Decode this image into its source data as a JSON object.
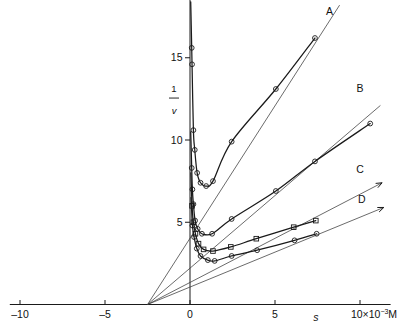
{
  "figure": {
    "title": "",
    "x_axis_label": "s",
    "x_axis_unit_label": "10×10⁻³M",
    "y_axis_label_numerator": "1",
    "y_axis_label_denominator": "v"
  },
  "axes": {
    "x_ticks": [
      {
        "value": -10,
        "label": "–10"
      },
      {
        "value": -5,
        "label": "–5"
      },
      {
        "value": 0,
        "label": "0"
      },
      {
        "value": 5,
        "label": "5"
      },
      {
        "value": 10,
        "label": "10×10⁻³M"
      }
    ],
    "y_ticks": [
      {
        "value": 5,
        "label": "5"
      },
      {
        "value": 10,
        "label": "10"
      },
      {
        "value": 15,
        "label": "15"
      }
    ]
  },
  "chart_data": {
    "type": "line",
    "title": "",
    "xlabel": "s",
    "ylabel": "1/v",
    "xlim": [
      -10.5,
      11.5
    ],
    "ylim": [
      0,
      18.5
    ],
    "grid": false,
    "legend_position": "inline-right-of-curve-ends",
    "x_unit": "10^-3 M",
    "annotations": [
      {
        "text": "A",
        "x": 8.2,
        "y": 17.6
      },
      {
        "text": "B",
        "x": 10.0,
        "y": 12.9
      },
      {
        "text": "C",
        "x": 10.0,
        "y": 8.0
      },
      {
        "text": "D",
        "x": 10.1,
        "y": 6.2
      },
      {
        "text": "s",
        "x": 7.4,
        "y": -1.35
      },
      {
        "text": "10×10⁻³M",
        "x": 10.0,
        "y": -1.35
      }
    ],
    "common_intersection": {
      "x": -2.5,
      "y": 0.0
    },
    "series": [
      {
        "name": "A",
        "marker": "circle",
        "points": [
          {
            "x": 0.1,
            "y": 15.6
          },
          {
            "x": 0.12,
            "y": 14.6
          },
          {
            "x": 0.2,
            "y": 10.6
          },
          {
            "x": 0.28,
            "y": 9.4
          },
          {
            "x": 0.42,
            "y": 8.0
          },
          {
            "x": 0.62,
            "y": 7.4
          },
          {
            "x": 0.95,
            "y": 7.2
          },
          {
            "x": 1.35,
            "y": 7.5
          },
          {
            "x": 2.45,
            "y": 9.9
          },
          {
            "x": 5.05,
            "y": 13.1
          },
          {
            "x": 7.35,
            "y": 16.2
          }
        ],
        "asymptote_line": {
          "x0": -2.5,
          "y0": 0.0,
          "x1": 8.8,
          "y1": 18.2
        }
      },
      {
        "name": "B",
        "marker": "circle",
        "points": [
          {
            "x": 0.1,
            "y": 8.3
          },
          {
            "x": 0.14,
            "y": 7.0
          },
          {
            "x": 0.2,
            "y": 6.1
          },
          {
            "x": 0.3,
            "y": 5.1
          },
          {
            "x": 0.45,
            "y": 4.6
          },
          {
            "x": 0.7,
            "y": 4.3
          },
          {
            "x": 1.3,
            "y": 4.3
          },
          {
            "x": 2.45,
            "y": 5.2
          },
          {
            "x": 5.05,
            "y": 6.9
          },
          {
            "x": 7.35,
            "y": 8.7
          },
          {
            "x": 10.6,
            "y": 11.0
          }
        ],
        "asymptote_line": {
          "x0": -2.5,
          "y0": 0.0,
          "x1": 11.2,
          "y1": 12.1
        }
      },
      {
        "name": "C",
        "marker": "square",
        "points": [
          {
            "x": 0.12,
            "y": 6.0
          },
          {
            "x": 0.2,
            "y": 5.0
          },
          {
            "x": 0.32,
            "y": 4.3
          },
          {
            "x": 0.5,
            "y": 3.7
          },
          {
            "x": 0.8,
            "y": 3.35
          },
          {
            "x": 1.35,
            "y": 3.25
          },
          {
            "x": 2.4,
            "y": 3.5
          },
          {
            "x": 3.9,
            "y": 4.0
          },
          {
            "x": 6.1,
            "y": 4.7
          },
          {
            "x": 7.4,
            "y": 5.1
          }
        ],
        "asymptote_line": {
          "x0": -2.5,
          "y0": 0.0,
          "x1": 11.3,
          "y1": 7.4
        }
      },
      {
        "name": "D",
        "marker": "circle",
        "points": [
          {
            "x": 0.14,
            "y": 4.8
          },
          {
            "x": 0.24,
            "y": 4.1
          },
          {
            "x": 0.4,
            "y": 3.4
          },
          {
            "x": 0.62,
            "y": 2.95
          },
          {
            "x": 1.05,
            "y": 2.7
          },
          {
            "x": 1.45,
            "y": 2.65
          },
          {
            "x": 2.45,
            "y": 2.95
          },
          {
            "x": 3.95,
            "y": 3.3
          },
          {
            "x": 6.15,
            "y": 3.9
          },
          {
            "x": 7.45,
            "y": 4.3
          }
        ],
        "asymptote_line": {
          "x0": -2.5,
          "y0": 0.0,
          "x1": 11.4,
          "y1": 5.9
        }
      }
    ]
  }
}
